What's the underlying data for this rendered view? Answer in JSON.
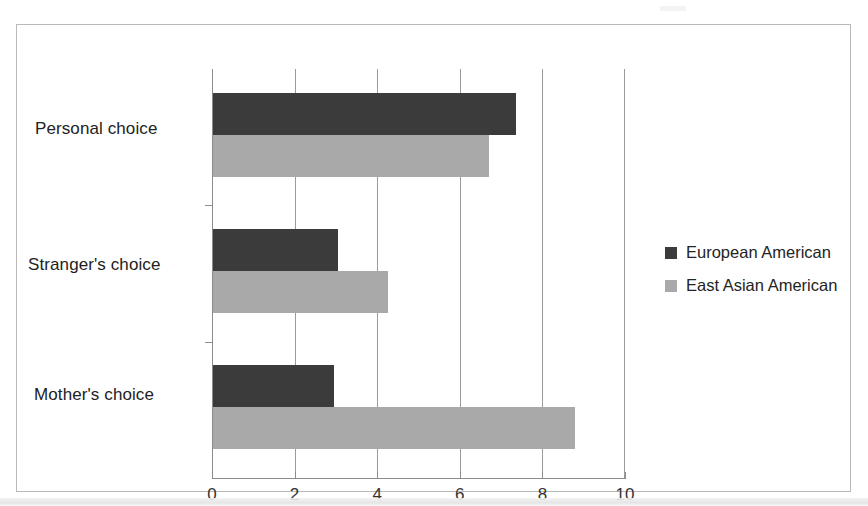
{
  "chart_data": {
    "type": "bar",
    "orientation": "horizontal",
    "title": "",
    "xlabel": "",
    "ylabel": "",
    "categories": [
      "Personal choice",
      "Stranger's choice",
      "Mother's choice"
    ],
    "series": [
      {
        "name": "European American",
        "color": "#3b3b3b",
        "values": [
          7.35,
          3.05,
          2.95
        ]
      },
      {
        "name": "East Asian American",
        "color": "#a9a9a9",
        "values": [
          6.7,
          4.25,
          8.8
        ]
      }
    ],
    "xlim": [
      0,
      10
    ],
    "xticks": [
      0,
      2,
      4,
      6,
      8,
      10
    ],
    "xtick_labels": [
      "0",
      "2",
      "4",
      "6",
      "8",
      "10"
    ],
    "grid": true,
    "grid_axis": "x",
    "legend_position": "right"
  },
  "legend": {
    "entries": [
      {
        "label": "European American",
        "color": "#3b3b3b"
      },
      {
        "label": "East Asian American",
        "color": "#a9a9a9"
      }
    ]
  },
  "axis": {
    "category_labels": [
      "Personal choice",
      "Stranger's choice",
      "Mother's choice"
    ],
    "tick_labels": [
      "0",
      "2",
      "4",
      "6",
      "8",
      "10"
    ]
  },
  "colors": {
    "series_dark": "#3b3b3b",
    "series_light": "#a9a9a9",
    "frame": "#b9b9b9",
    "axis": "#8c8c8c",
    "grid": "#9a9a9a",
    "text": "#222222",
    "background": "#ffffff"
  }
}
